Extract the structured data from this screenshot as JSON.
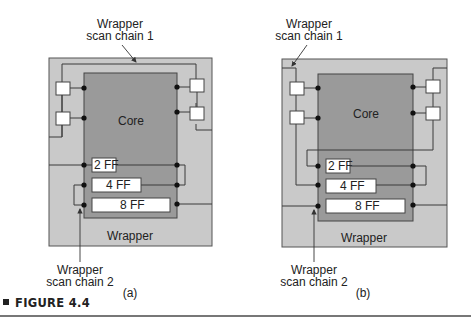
{
  "colors": {
    "wrapper": "#c9c9c9",
    "core": "#9a9a9a",
    "line": "#3a3a3a",
    "cell": "#ffffff",
    "dot": "#111111"
  },
  "figure": {
    "caption_label": "FIGURE 4.4",
    "panels": [
      {
        "id": "a",
        "sublabel": "(a)",
        "core_label": "Core",
        "wrapper_label": "Wrapper",
        "scan_chain_1_label": [
          "Wrapper",
          "scan chain 1"
        ],
        "scan_chain_2_label": [
          "Wrapper",
          "scan chain 2"
        ],
        "internal_chains": [
          "2 FF",
          "4 FF",
          "8 FF"
        ]
      },
      {
        "id": "b",
        "sublabel": "(b)",
        "core_label": "Core",
        "wrapper_label": "Wrapper",
        "scan_chain_1_label": [
          "Wrapper",
          "scan chain 1"
        ],
        "scan_chain_2_label": [
          "Wrapper",
          "scan chain 2"
        ],
        "internal_chains": [
          "2 FF",
          "4 FF",
          "8 FF"
        ]
      }
    ]
  }
}
